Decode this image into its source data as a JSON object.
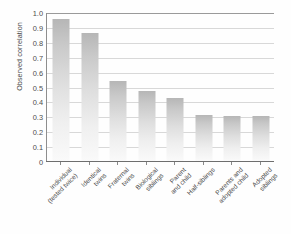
{
  "chart_data": {
    "type": "bar",
    "title": "",
    "xlabel": "",
    "ylabel": "Observed correlation",
    "ylim": [
      0,
      1.0
    ],
    "ytick_labels": [
      "1.0",
      "0.9",
      "0.8",
      "0.7",
      "0.6",
      "0.5",
      "0.4",
      "0.3",
      "0.2",
      "0.1",
      "0"
    ],
    "ytick_values": [
      1.0,
      0.9,
      0.8,
      0.7,
      0.6,
      0.5,
      0.4,
      0.3,
      0.2,
      0.1,
      0
    ],
    "grid": true,
    "legend": "none",
    "categories": [
      "Individual\n(tested twice)",
      "Identical\ntwins",
      "Fraternal\ntwins",
      "Biological\nsiblings",
      "Parent\nand child",
      "Half-siblings",
      "Parents and\nadopted child",
      "Adopted\nsiblings"
    ],
    "values": [
      0.95,
      0.86,
      0.54,
      0.47,
      0.42,
      0.31,
      0.3,
      0.3
    ],
    "bar_color_top": "#b6b6b6",
    "bar_color_bottom": "#fafafa",
    "grid_color": "#d8d8d8",
    "axis_color": "#6e6e6e",
    "background": "#fefefe"
  }
}
